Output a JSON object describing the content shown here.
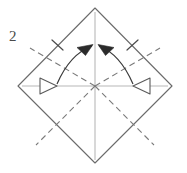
{
  "figure": {
    "type": "origami-fold-diagram",
    "step_number": "2",
    "width": 187,
    "height": 173,
    "background_color": "#ffffff"
  },
  "colors": {
    "outline": "#6b6b6b",
    "crease_dashed": "#7a7a7a",
    "axis_line": "#b0b0b0",
    "arrow_solid": "#2b2b2b",
    "arrow_hollow_stroke": "#5a5a5a",
    "arrow_hollow_fill": "#ffffff",
    "tick_mark": "#4a4a4a",
    "label_text": "#4a4a4a"
  },
  "shapes": {
    "diamond": {
      "name": "paper-outline-diamond",
      "points": "95,8 172,86 95,163 18,86",
      "stroke_width": 1.1
    },
    "center_point": {
      "x": 95,
      "y": 86
    },
    "vertical_axis": {
      "x1": 95,
      "y1": 12,
      "x2": 95,
      "y2": 160
    },
    "horizontal_axis": {
      "x1": 22,
      "y1": 86,
      "x2": 168,
      "y2": 86
    }
  },
  "creases": [
    {
      "name": "crease-upper-left",
      "x1": 95,
      "y1": 86,
      "x2": 30,
      "y2": 48
    },
    {
      "name": "crease-upper-right",
      "x1": 95,
      "y1": 86,
      "x2": 160,
      "y2": 48
    },
    {
      "name": "crease-lower-left",
      "x1": 95,
      "y1": 86,
      "x2": 36,
      "y2": 145
    },
    {
      "name": "crease-lower-right",
      "x1": 95,
      "y1": 86,
      "x2": 154,
      "y2": 145
    }
  ],
  "arrows": {
    "left": {
      "name": "fold-arrow-left",
      "arc_path": "M 57,84 Q 70,54 92,46",
      "solid_head": "92,45 78,47 85,55",
      "hollow_head": "41,79 57,86 41,93",
      "description": "curved fold arrow from left corner region up to top center"
    },
    "right": {
      "name": "fold-arrow-right",
      "arc_path": "M 133,84 Q 120,54 99,46",
      "solid_head": "99,45 113,47 106,55",
      "hollow_head": "149,79 133,86 149,93",
      "description": "curved fold arrow from right corner region up to top center"
    }
  },
  "tick_marks": [
    {
      "name": "tick-upper-left-edge",
      "x1": 52,
      "y1": 40,
      "x2": 63,
      "y2": 50
    },
    {
      "name": "tick-upper-right-edge",
      "x1": 138,
      "y1": 40,
      "x2": 127,
      "y2": 50
    }
  ]
}
